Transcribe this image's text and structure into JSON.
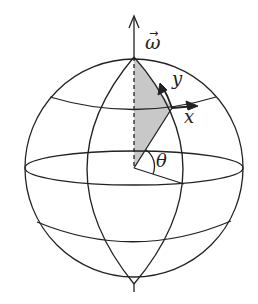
{
  "diagram": {
    "type": "sphere-rotation-frame",
    "labels": {
      "omega": "ω",
      "omega_arrow": "→",
      "y": "y",
      "x": "x",
      "theta": "θ"
    },
    "colors": {
      "stroke": "#222222",
      "shade": "#c8c8c8",
      "background": "#ffffff"
    },
    "geometry": {
      "center": [
        134,
        168
      ],
      "radius": 109,
      "north_pole": [
        134,
        57
      ],
      "axis_arrow_tip": [
        134,
        16
      ],
      "local_point": [
        172,
        108
      ],
      "theta_ray_end": [
        184,
        184
      ]
    }
  }
}
